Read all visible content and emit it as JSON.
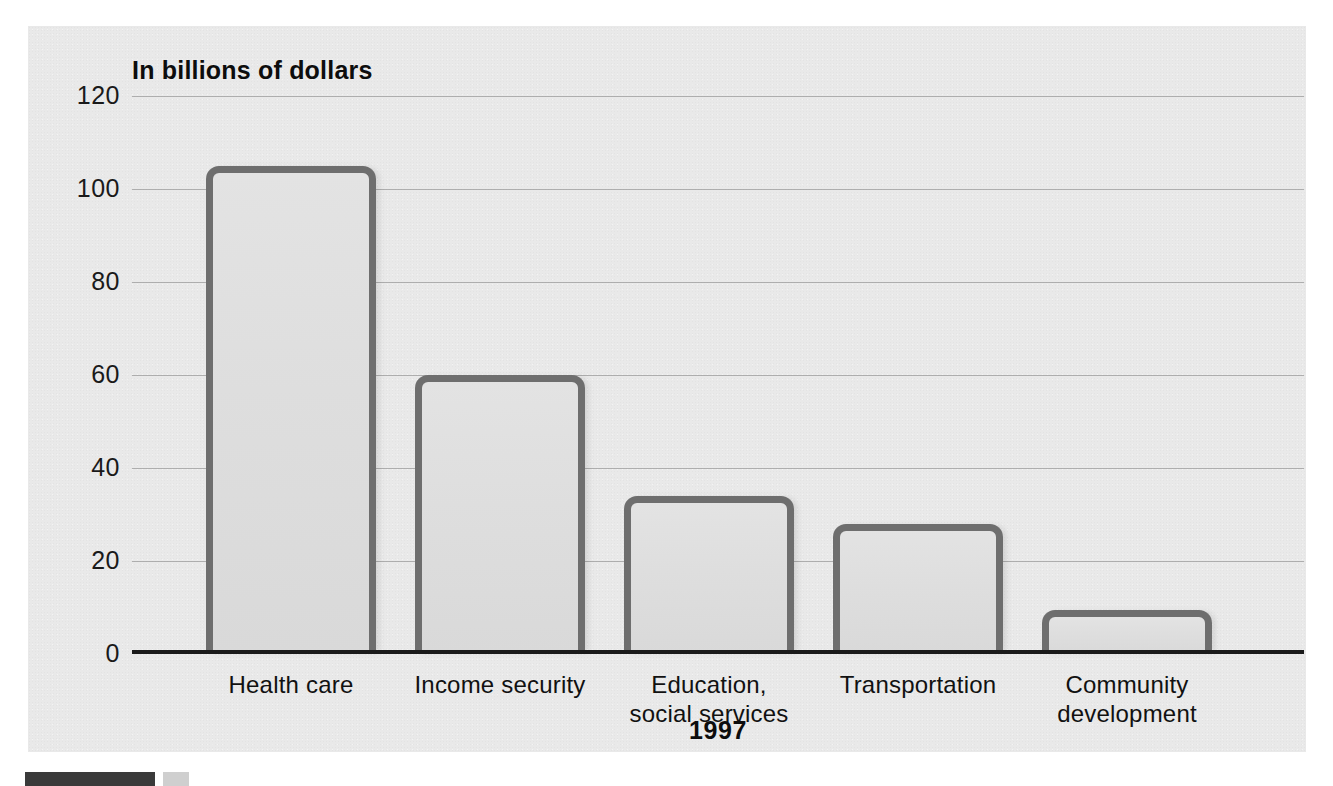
{
  "chart_data": {
    "type": "bar",
    "title": "In billions of dollars",
    "xlabel": "1997",
    "ylabel": "",
    "categories": [
      "Health care",
      "Income security",
      "Education,\nsocial services",
      "Transportation",
      "Community\ndevelopment"
    ],
    "category_lines": [
      [
        "Health care"
      ],
      [
        "Income security"
      ],
      [
        "Education,",
        "social services"
      ],
      [
        "Transportation"
      ],
      [
        "Community",
        "development"
      ]
    ],
    "values": [
      105,
      60,
      34,
      28,
      9.5
    ],
    "ylim": [
      0,
      120
    ],
    "yticks": [
      120,
      100,
      80,
      60,
      40,
      20,
      0
    ],
    "ytick_labels": [
      "120",
      "100",
      "80",
      "60",
      "40",
      "20",
      "0"
    ],
    "grid": true,
    "legend": "none",
    "colors": {
      "panel_background": "#e9e9e9",
      "bar_fill": "#dedede",
      "bar_border": "#6e6e6e",
      "gridline": "#9a9a9a",
      "axis": "#1b1b1b",
      "text": "#111111"
    }
  },
  "figure": {
    "axis_title": "In billions of dollars",
    "series_label": "1997"
  }
}
